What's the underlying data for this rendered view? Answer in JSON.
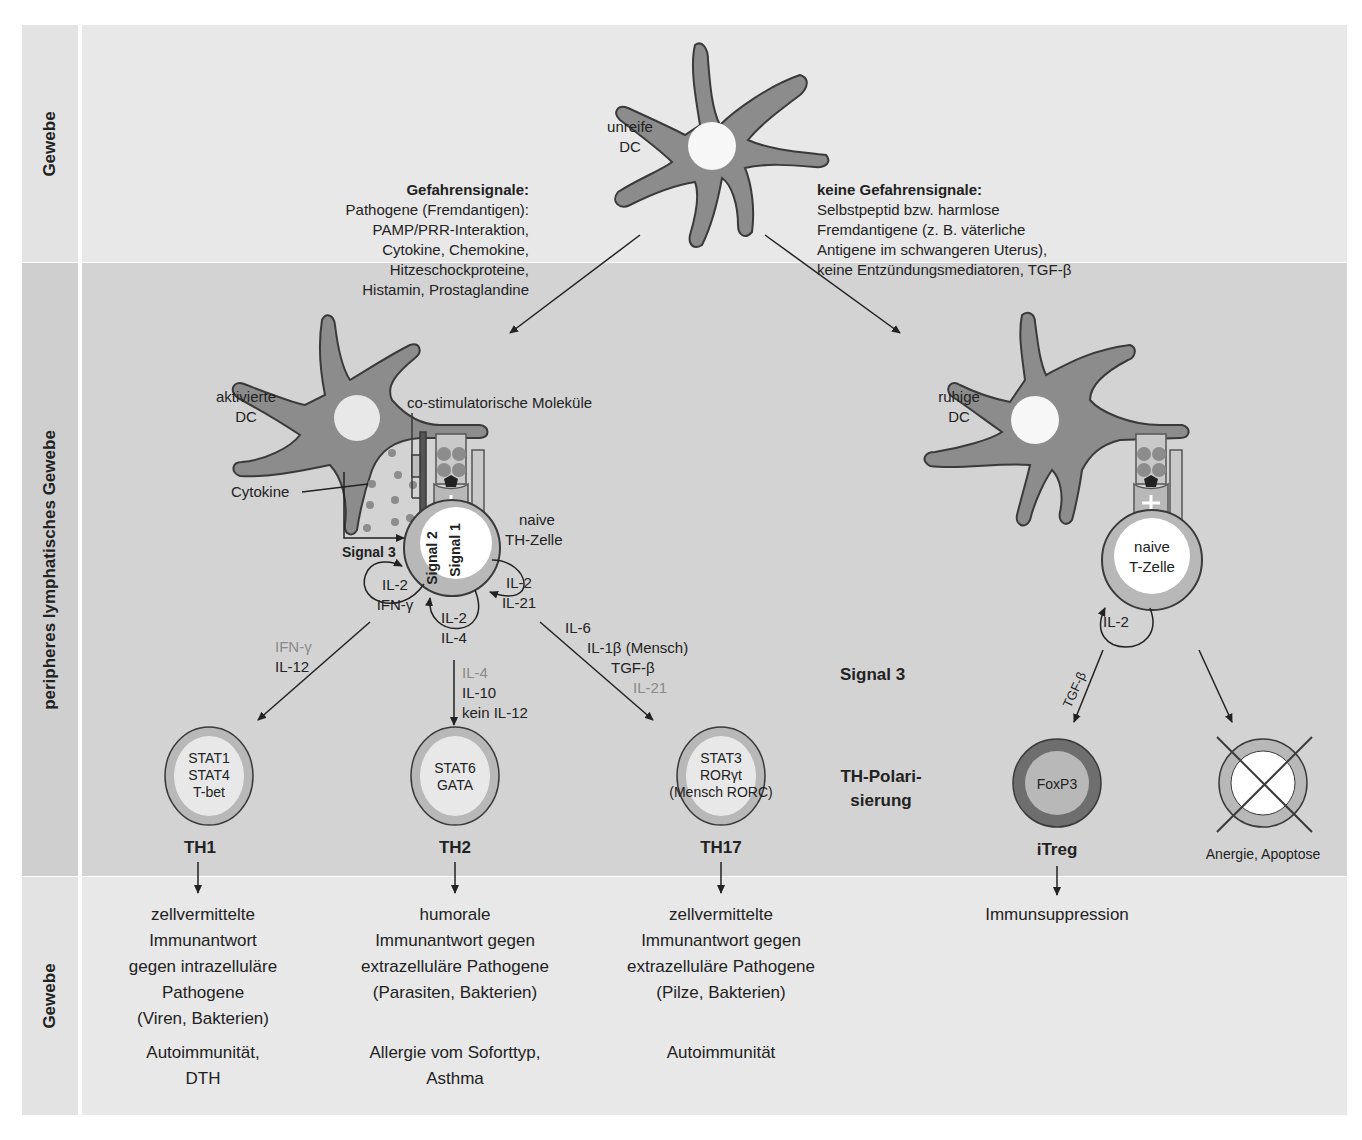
{
  "colors": {
    "page_bg": "#ffffff",
    "tissue_band": "#e8e8e8",
    "lymph_band": "#d3d3d3",
    "cell_body": "#8c8c8c",
    "cell_outline": "#3a3a3a",
    "nucleus": "#f7f7f7",
    "tcell_ring": "#b8b8b8",
    "treg_ring": "#6e6e6e",
    "grey_text": "#8a8a8a"
  },
  "row_labels": {
    "top": "Gewebe",
    "middle": "peripheres lymphatisches Gewebe",
    "bottom": "Gewebe"
  },
  "top": {
    "immature_dc": [
      "unreife",
      "DC"
    ],
    "danger": {
      "title": "Gefahrensignale:",
      "lines": [
        "Pathogene (Fremdantigen):",
        "PAMP/PRR-Interaktion,",
        "Cytokine, Chemokine,",
        "Hitzeschockproteine,",
        "Histamin, Prostaglandine"
      ]
    },
    "no_danger": {
      "title": "keine Gefahrensignale:",
      "lines": [
        "Selbstpeptid bzw. harmlose",
        "Fremdantigene (z. B. väterliche",
        "Antigene im schwangeren Uterus),",
        "keine Entzündungsmediatoren, TGF-β"
      ]
    }
  },
  "left_synapse": {
    "dc_label": [
      "aktivierte",
      "DC"
    ],
    "costim_label": "co-stimulatorische Moleküle",
    "cytokine_label": "Cytokine",
    "signal3": "Signal 3",
    "signal2": "Signal 2",
    "signal1": "Signal 1",
    "tcell_label": [
      "naive",
      "TH-Zelle"
    ],
    "loops": {
      "left": [
        "IL-2",
        "IFN-γ"
      ],
      "bottom": [
        "IL-2",
        "IL-4"
      ],
      "right": [
        "IL-2",
        "IL-21"
      ]
    },
    "arrows": {
      "th1": [
        {
          "text": "IFN-γ",
          "grey": true
        },
        {
          "text": "IL-12",
          "grey": false
        }
      ],
      "th2": [
        {
          "text": "IL-4",
          "grey": true
        },
        {
          "text": "IL-10",
          "grey": false
        },
        {
          "text": "kein IL-12",
          "grey": false
        }
      ],
      "th17": [
        {
          "text": "IL-6",
          "grey": false
        },
        {
          "text": "IL-1β (Mensch)",
          "grey": false
        },
        {
          "text": "TGF-β",
          "grey": false
        },
        {
          "text": "IL-21",
          "grey": true
        }
      ]
    }
  },
  "right_synapse": {
    "dc_label": [
      "ruhige",
      "DC"
    ],
    "tcell_label": [
      "naive",
      "T-Zelle"
    ],
    "loop": "IL-2",
    "arrow_label": "TGF-β"
  },
  "center_labels": {
    "signal3": "Signal 3",
    "polarization": [
      "TH-Polari-",
      "sierung"
    ]
  },
  "subsets": [
    {
      "name": "TH1",
      "factors": [
        "STAT1",
        "STAT4",
        "T-bet"
      ],
      "response": [
        "zellvermittelte",
        "Immunantwort",
        "gegen intrazelluläre",
        "Pathogene",
        "(Viren, Bakterien)"
      ],
      "disease": [
        "Autoimmunität,",
        "DTH"
      ]
    },
    {
      "name": "TH2",
      "factors": [
        "STAT6",
        "GATA"
      ],
      "response": [
        "humorale",
        "Immunantwort gegen",
        "extrazelluläre Pathogene",
        "(Parasiten, Bakterien)"
      ],
      "disease": [
        "Allergie vom Soforttyp,",
        "Asthma"
      ]
    },
    {
      "name": "TH17",
      "factors": [
        "STAT3",
        "RORγt",
        "(Mensch RORC)"
      ],
      "response": [
        "zellvermittelte",
        "Immunantwort gegen",
        "extrazelluläre Pathogene",
        "(Pilze, Bakterien)"
      ],
      "disease": [
        "Autoimmunität"
      ]
    },
    {
      "name": "iTreg",
      "factors": [
        "FoxP3"
      ],
      "response": [
        "Immunsuppression"
      ],
      "disease": []
    }
  ],
  "anergy_label": "Anergie, Apoptose"
}
